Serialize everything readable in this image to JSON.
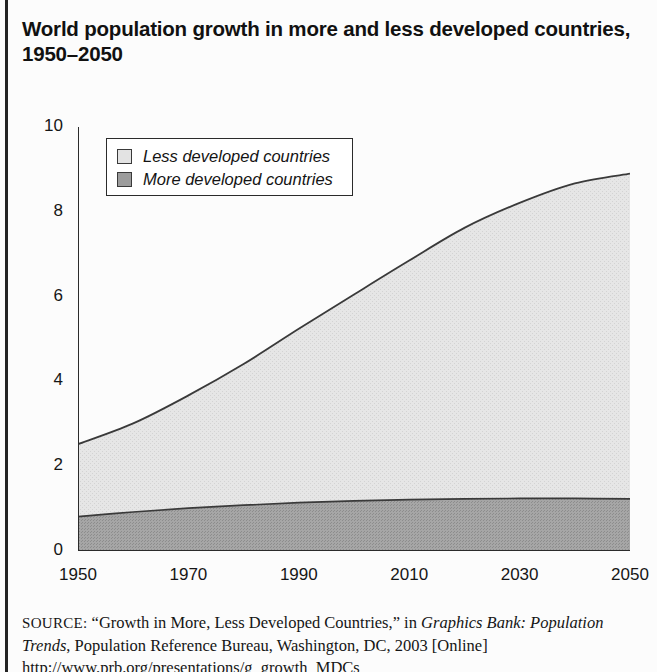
{
  "title": "World population growth in more and less developed countries,\n1950–2050",
  "legend": {
    "items": [
      {
        "label": "Less developed countries",
        "color": "#e3e3e3",
        "key": "less"
      },
      {
        "label": "More developed countries",
        "color": "#9c9c9c",
        "key": "more"
      }
    ]
  },
  "source": {
    "prefix": "SOURCE:",
    "line1_a": " “Growth in More, Less Developed Countries,” in ",
    "line1_italic": "Graphics",
    "line2_italic": "Bank: Population Trends",
    "line2_b": ", Population Reference Bureau, Washington,",
    "line3": "DC, 2003 [Online] http://www.prb.org/presentations/g_growth_MDCs"
  },
  "chart_data": {
    "type": "area",
    "stacked": true,
    "title": "World population growth in more and less developed countries, 1950–2050",
    "xlabel": "",
    "ylabel": "Billions",
    "xlim": [
      1950,
      2050
    ],
    "ylim": [
      0,
      10
    ],
    "grid": false,
    "legend_position": "upper-left-inside",
    "xticks": [
      1950,
      1970,
      1990,
      2010,
      2030,
      2050
    ],
    "xtick_labels": [
      "1950",
      "1970",
      "1990",
      "2010",
      "2030",
      "2050"
    ],
    "yticks": [
      0,
      2,
      4,
      6,
      8,
      10
    ],
    "ytick_labels": [
      "0",
      "2",
      "4",
      "6",
      "8",
      "10"
    ],
    "x": [
      1950,
      1960,
      1970,
      1980,
      1990,
      2000,
      2010,
      2020,
      2030,
      2040,
      2050
    ],
    "series": [
      {
        "name": "More developed countries",
        "color": "#9c9c9c",
        "values": [
          0.81,
          0.92,
          1.01,
          1.08,
          1.14,
          1.18,
          1.21,
          1.23,
          1.24,
          1.24,
          1.23
        ]
      },
      {
        "name": "Less developed countries",
        "color": "#e3e3e3",
        "values": [
          1.71,
          2.09,
          2.66,
          3.33,
          4.1,
          4.87,
          5.64,
          6.39,
          6.97,
          7.43,
          7.67
        ]
      }
    ],
    "totals": [
      2.52,
      3.01,
      3.67,
      4.41,
      5.24,
      6.05,
      6.85,
      7.62,
      8.21,
      8.67,
      8.9
    ],
    "units": "billions of people"
  }
}
